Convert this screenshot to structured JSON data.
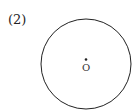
{
  "figure": {
    "label": "(2)",
    "circle": {
      "cx": 86,
      "cy": 64,
      "r": 45,
      "stroke": "#222222"
    },
    "center_point": {
      "cx": 86,
      "cy": 60,
      "r": 1.3
    },
    "center_label": "O"
  }
}
